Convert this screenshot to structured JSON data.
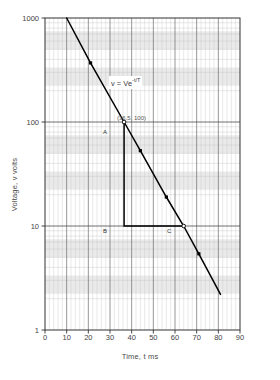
{
  "chart_data": {
    "type": "line",
    "title": "",
    "xlabel": "Time, t ms",
    "ylabel": "Voltage, v volts",
    "yscale": "log",
    "xscale": "linear",
    "xlim": [
      0,
      90
    ],
    "ylim": [
      1,
      1000
    ],
    "xticks": [
      0,
      10,
      20,
      30,
      40,
      50,
      60,
      70,
      80,
      90
    ],
    "xtick_labels": [
      "0",
      "10",
      "20",
      "30",
      "40",
      "50",
      "60",
      "70",
      "80",
      "90"
    ],
    "yticks": [
      1,
      10,
      100,
      1000
    ],
    "ytick_labels": [
      "1",
      "10",
      "100",
      "1000"
    ],
    "grid": true,
    "grid_minor": true,
    "legend": "none",
    "series": [
      {
        "name": "v = Ve^(-t/T)",
        "line_color": "#000000",
        "marker": "square",
        "marker_color": "#000000",
        "x": [
          10,
          21,
          36.5,
          44,
          56,
          64,
          71,
          81
        ],
        "y": [
          1000,
          370,
          100,
          53,
          19,
          10,
          5.4,
          2.2
        ]
      }
    ],
    "annotations": [
      {
        "name": "equation",
        "text": "v = Ve",
        "exponent": "-t/T",
        "x": 22,
        "y": 300
      },
      {
        "name": "coordinate",
        "text": "(36.5, 100)",
        "x": 36.5,
        "y": 100
      },
      {
        "name": "point-a",
        "text": "A",
        "x": 36.5,
        "y": 100
      },
      {
        "name": "point-b",
        "text": "B",
        "x": 36.5,
        "y": 10
      },
      {
        "name": "point-c",
        "text": "C",
        "x": 64,
        "y": 10
      }
    ],
    "construction_triangle": {
      "vertices": [
        [
          36.5,
          100
        ],
        [
          36.5,
          10
        ],
        [
          64,
          10
        ]
      ],
      "color": "#000000"
    }
  }
}
